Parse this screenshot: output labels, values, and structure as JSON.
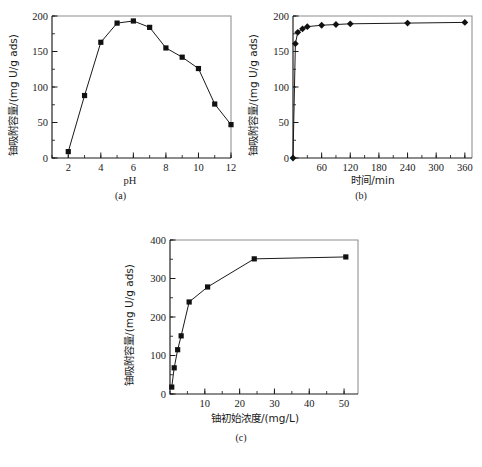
{
  "figure": {
    "background": "#ffffff",
    "ink": "#1a1a1a",
    "panels": [
      {
        "id": "a",
        "caption": "(a)"
      },
      {
        "id": "b",
        "caption": "(b)"
      },
      {
        "id": "c",
        "caption": "(c)"
      }
    ]
  },
  "captions": {
    "a": "(a)",
    "b": "(b)",
    "c": "(c)"
  },
  "chart_data": [
    {
      "type": "line",
      "panel": "a",
      "title": "",
      "xlabel": "pH",
      "ylabel": "铀吸附容量/(mg U/g ads)",
      "xlim": [
        1,
        12
      ],
      "ylim": [
        0,
        200
      ],
      "xticks": [
        2,
        4,
        6,
        8,
        10,
        12
      ],
      "xticklabels": [
        "2",
        "4",
        "6",
        "8",
        "10",
        "12"
      ],
      "yticks": [
        0,
        50,
        100,
        150,
        200
      ],
      "yticklabels": [
        "0",
        "50",
        "100",
        "150",
        "200"
      ],
      "x_minor_step": 1,
      "y_minor_step": 25,
      "grid": false,
      "legend": false,
      "marker": "square",
      "x": [
        2,
        3,
        4,
        5,
        6,
        7,
        8,
        9,
        10,
        11,
        12
      ],
      "values": [
        9,
        88,
        163,
        190,
        193,
        184,
        155,
        142,
        126,
        76,
        47
      ]
    },
    {
      "type": "line",
      "panel": "b",
      "title": "",
      "xlabel": "时间/min",
      "ylabel": "铀吸附容量/(mg U/g ads)",
      "xlim": [
        0,
        375
      ],
      "ylim": [
        0,
        200
      ],
      "xticks": [
        60,
        120,
        180,
        240,
        300,
        360
      ],
      "xticklabels": [
        "60",
        "120",
        "180",
        "240",
        "300",
        "360"
      ],
      "yticks": [
        0,
        50,
        100,
        150,
        200
      ],
      "yticklabels": [
        "0",
        "50",
        "100",
        "150",
        "200"
      ],
      "x_minor_step": 30,
      "y_minor_step": 25,
      "grid": false,
      "legend": false,
      "marker": "diamond",
      "x": [
        0,
        5,
        10,
        20,
        30,
        60,
        90,
        120,
        240,
        360
      ],
      "values": [
        0,
        161,
        177,
        182,
        185,
        187,
        188,
        189,
        190,
        191
      ]
    },
    {
      "type": "line",
      "panel": "c",
      "title": "",
      "xlabel": "铀初始浓度/(mg/L)",
      "ylabel": "铀吸附容量/(mg U/g ads)",
      "xlim": [
        0,
        54
      ],
      "ylim": [
        0,
        400
      ],
      "xticks": [
        10,
        20,
        30,
        40,
        50
      ],
      "xticklabels": [
        "10",
        "20",
        "30",
        "40",
        "50"
      ],
      "yticks": [
        0,
        100,
        200,
        300,
        400
      ],
      "yticklabels": [
        "0",
        "100",
        "200",
        "300",
        "400"
      ],
      "x_minor_step": 5,
      "y_minor_step": 50,
      "grid": false,
      "legend": false,
      "marker": "square",
      "x": [
        0.5,
        1.2,
        2.2,
        3.2,
        5.5,
        10.8,
        24.2,
        50.5
      ],
      "values": [
        18,
        68,
        115,
        151,
        239,
        278,
        351,
        356
      ]
    }
  ]
}
